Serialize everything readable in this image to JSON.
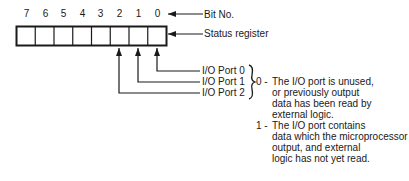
{
  "diagram": {
    "bit_numbers": [
      "7",
      "6",
      "5",
      "4",
      "3",
      "2",
      "1",
      "0"
    ],
    "labels": {
      "bit_no": "Bit No.",
      "status_register": "Status register"
    },
    "ports": [
      {
        "label": "I/O Port 0",
        "bit": 0
      },
      {
        "label": "I/O Port 1",
        "bit": 1
      },
      {
        "label": "I/O Port 2",
        "bit": 2
      }
    ],
    "meaning": {
      "zero": {
        "key": "0 -",
        "lines": [
          "The I/O port is unused,",
          "or previously output",
          "data has been read by",
          "external logic."
        ]
      },
      "one": {
        "key": "1 -",
        "lines": [
          "The I/O port contains",
          "data which the microprocessor",
          "output, and external",
          "logic has not yet read."
        ]
      }
    }
  }
}
